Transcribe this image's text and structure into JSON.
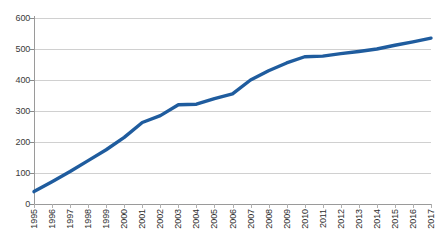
{
  "chart_data": {
    "type": "line",
    "title": "",
    "xlabel": "",
    "ylabel": "",
    "ylim": [
      0,
      600
    ],
    "yticks": [
      0,
      100,
      200,
      300,
      400,
      500,
      600
    ],
    "grid": true,
    "legend": "none",
    "line_color": "#1F5C9E",
    "categories": [
      "1995",
      "1996",
      "1997",
      "1998",
      "1999",
      "2000",
      "2001",
      "2002",
      "2003",
      "2004",
      "2005",
      "2006",
      "2007",
      "2008",
      "2009",
      "2010",
      "2011",
      "2012",
      "2013",
      "2014",
      "2015",
      "2016",
      "2017"
    ],
    "values": [
      40,
      72,
      105,
      140,
      175,
      215,
      263,
      285,
      320,
      322,
      340,
      355,
      400,
      430,
      455,
      475,
      477,
      485,
      492,
      500,
      512,
      523,
      535
    ],
    "series": [
      {
        "name": "series-1",
        "values": [
          40,
          72,
          105,
          140,
          175,
          215,
          263,
          285,
          320,
          322,
          340,
          355,
          400,
          430,
          455,
          475,
          477,
          485,
          492,
          500,
          512,
          523,
          535
        ]
      }
    ]
  },
  "axis": {
    "y_tick_labels": [
      "600",
      "500",
      "400",
      "300",
      "200",
      "100",
      "0"
    ],
    "x_tick_labels": [
      "1995",
      "1996",
      "1997",
      "1998",
      "1999",
      "2000",
      "2001",
      "2002",
      "2003",
      "2004",
      "2005",
      "2006",
      "2007",
      "2008",
      "2009",
      "2010",
      "2011",
      "2012",
      "2013",
      "2014",
      "2015",
      "2016",
      "2017"
    ]
  },
  "header": {
    "cropped_title": ""
  }
}
